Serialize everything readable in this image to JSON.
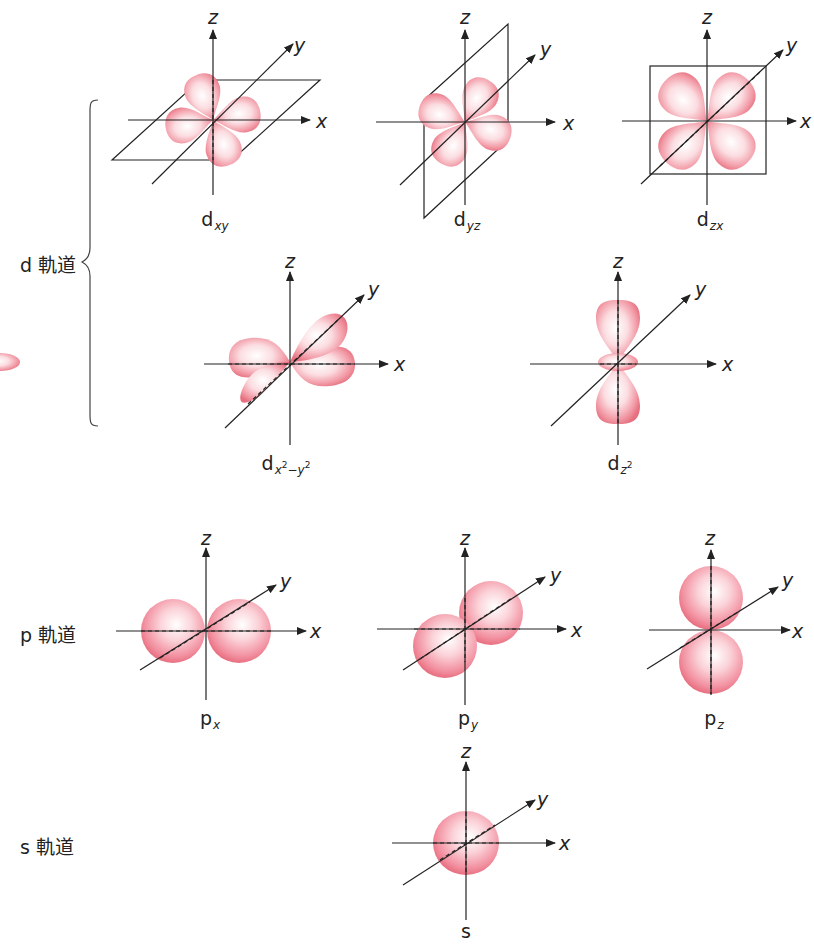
{
  "groups": [
    {
      "id": "d",
      "label": "d 軌道"
    },
    {
      "id": "p",
      "label": "p 軌道"
    },
    {
      "id": "s",
      "label": "s 軌道"
    }
  ],
  "axes": {
    "x": "x",
    "y": "y",
    "z": "z"
  },
  "orbitals": [
    {
      "id": "dxy",
      "main": "d",
      "sub": "xy",
      "group": "d"
    },
    {
      "id": "dyz",
      "main": "d",
      "sub": "yz",
      "group": "d"
    },
    {
      "id": "dzx",
      "main": "d",
      "sub": "zx",
      "group": "d"
    },
    {
      "id": "dx2y2",
      "main": "d",
      "sub": "x2−y2",
      "sub_parts": [
        "x",
        "2",
        "−y",
        "2"
      ],
      "group": "d"
    },
    {
      "id": "dz2",
      "main": "d",
      "sub": "z2",
      "sub_parts": [
        "z",
        "2"
      ],
      "group": "d"
    },
    {
      "id": "px",
      "main": "p",
      "sub": "x",
      "group": "p"
    },
    {
      "id": "py",
      "main": "p",
      "sub": "y",
      "group": "p"
    },
    {
      "id": "pz",
      "main": "p",
      "sub": "z",
      "group": "p"
    },
    {
      "id": "s",
      "main": "s",
      "sub": "",
      "group": "s"
    }
  ],
  "colors": {
    "lobe_edge": "#e8707e",
    "lobe_mid": "#f4a6b0",
    "lobe_highlight": "#ffffff",
    "line": "#222222"
  }
}
